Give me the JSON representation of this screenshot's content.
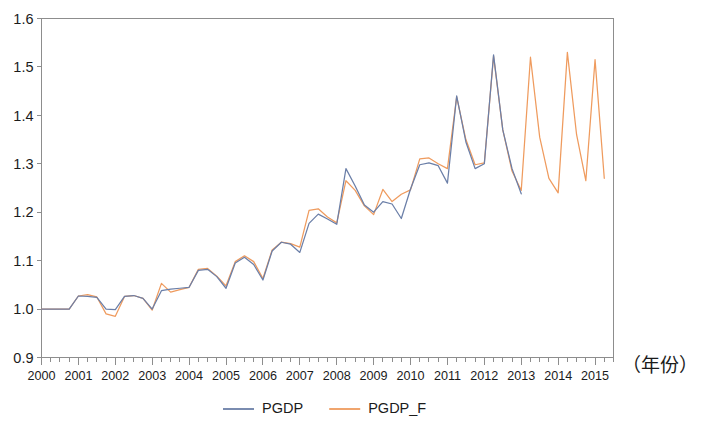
{
  "chart_data": {
    "type": "line",
    "title": "",
    "subtitle": "",
    "xlabel": "(年份)",
    "ylabel": "",
    "xlim": [
      2000.0,
      2015.5
    ],
    "ylim": [
      0.9,
      1.6
    ],
    "ytick_labels": [
      "0.9",
      "1.0",
      "1.1",
      "1.2",
      "1.3",
      "1.4",
      "1.5",
      "1.6"
    ],
    "ytick_values": [
      0.9,
      1.0,
      1.1,
      1.2,
      1.3,
      1.4,
      1.5,
      1.6
    ],
    "xtick_labels": [
      "2000",
      "2001",
      "2002",
      "2003",
      "2004",
      "2005",
      "2006",
      "2007",
      "2008",
      "2009",
      "2010",
      "2011",
      "2012",
      "2013",
      "2014",
      "2015"
    ],
    "xtick_values": [
      2000,
      2001,
      2002,
      2003,
      2004,
      2005,
      2006,
      2007,
      2008,
      2009,
      2010,
      2011,
      2012,
      2013,
      2014,
      2015
    ],
    "minor_ticks_per_interval": 4,
    "grid": false,
    "legend_position": "bottom-center",
    "frequency": "quarterly",
    "colors": {
      "pgdp": "#6b7fa8",
      "pgdp_f": "#ef9b5e",
      "axis": "#8d8d8d",
      "text": "#1b1b1b",
      "background": "#ffffff"
    },
    "series": [
      {
        "name": "PGDP",
        "color": "#6b7fa8",
        "x": [
          2000.0,
          2000.25,
          2000.5,
          2000.75,
          2001.0,
          2001.25,
          2001.5,
          2001.75,
          2002.0,
          2002.25,
          2002.5,
          2002.75,
          2003.0,
          2003.25,
          2003.5,
          2003.75,
          2004.0,
          2004.25,
          2004.5,
          2004.75,
          2005.0,
          2005.25,
          2005.5,
          2005.75,
          2006.0,
          2006.25,
          2006.5,
          2006.75,
          2007.0,
          2007.25,
          2007.5,
          2007.75,
          2008.0,
          2008.25,
          2008.5,
          2008.75,
          2009.0,
          2009.25,
          2009.5,
          2009.75,
          2010.0,
          2010.25,
          2010.5,
          2010.75,
          2011.0,
          2011.25,
          2011.5,
          2011.75,
          2012.0,
          2012.25,
          2012.5,
          2012.75,
          2013.0
        ],
        "values": [
          1.0,
          1.0,
          1.0,
          1.0,
          1.027,
          1.026,
          1.024,
          1.0,
          0.999,
          1.026,
          1.028,
          1.022,
          1.0,
          1.038,
          1.041,
          1.043,
          1.045,
          1.08,
          1.082,
          1.067,
          1.043,
          1.095,
          1.107,
          1.092,
          1.06,
          1.12,
          1.138,
          1.134,
          1.117,
          1.177,
          1.196,
          1.186,
          1.175,
          1.29,
          1.254,
          1.215,
          1.2,
          1.222,
          1.217,
          1.187,
          1.248,
          1.298,
          1.302,
          1.296,
          1.26,
          1.44,
          1.345,
          1.29,
          1.3,
          1.525,
          1.37,
          1.29,
          1.238
        ]
      },
      {
        "name": "PGDP_F",
        "color": "#ef9b5e",
        "x": [
          2000.0,
          2000.25,
          2000.5,
          2000.75,
          2001.0,
          2001.25,
          2001.5,
          2001.75,
          2002.0,
          2002.25,
          2002.5,
          2002.75,
          2003.0,
          2003.25,
          2003.5,
          2003.75,
          2004.0,
          2004.25,
          2004.5,
          2004.75,
          2005.0,
          2005.25,
          2005.5,
          2005.75,
          2006.0,
          2006.25,
          2006.5,
          2006.75,
          2007.0,
          2007.25,
          2007.5,
          2007.75,
          2008.0,
          2008.25,
          2008.5,
          2008.75,
          2009.0,
          2009.25,
          2009.5,
          2009.75,
          2010.0,
          2010.25,
          2010.5,
          2010.75,
          2011.0,
          2011.25,
          2011.5,
          2011.75,
          2012.0,
          2012.25,
          2012.5,
          2012.75,
          2013.0,
          2013.25,
          2013.5,
          2013.75,
          2014.0,
          2014.25,
          2014.5,
          2014.75,
          2015.0,
          2015.25
        ],
        "values": [
          1.0,
          1.0,
          1.0,
          1.0,
          1.027,
          1.03,
          1.025,
          0.99,
          0.985,
          1.026,
          1.028,
          1.022,
          0.998,
          1.053,
          1.035,
          1.04,
          1.045,
          1.082,
          1.084,
          1.068,
          1.048,
          1.098,
          1.11,
          1.098,
          1.063,
          1.122,
          1.138,
          1.135,
          1.128,
          1.204,
          1.207,
          1.19,
          1.178,
          1.265,
          1.245,
          1.213,
          1.195,
          1.247,
          1.222,
          1.237,
          1.246,
          1.31,
          1.312,
          1.3,
          1.29,
          1.438,
          1.35,
          1.298,
          1.302,
          1.522,
          1.37,
          1.285,
          1.245,
          1.52,
          1.355,
          1.27,
          1.24,
          1.53,
          1.36,
          1.265,
          1.515,
          1.27
        ]
      }
    ],
    "notes": {
      "pgdp_end": "2013Q1",
      "pgdp_f_end": "2015Q2",
      "pattern": "strong quarterly seasonality, rising trend; forecast series extends beyond observed series"
    }
  },
  "legend": {
    "items": [
      {
        "label": "PGDP",
        "color": "#6b7fa8"
      },
      {
        "label": "PGDP_F",
        "color": "#ef9b5e"
      }
    ]
  },
  "axis_caption": "（年份）"
}
